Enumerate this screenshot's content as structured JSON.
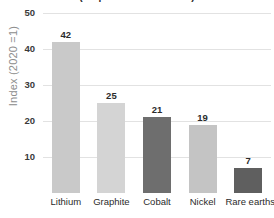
{
  "chart_data": {
    "type": "bar",
    "title": "(output relative to 2020)",
    "xlabel": "",
    "ylabel": "Index (2020 =1)",
    "categories": [
      "Lithium",
      "Graphite",
      "Cobalt",
      "Nickel",
      "Rare earths"
    ],
    "values": [
      42,
      25,
      21,
      19,
      7
    ],
    "value_labels": [
      "42",
      "25",
      "21",
      "19",
      "7"
    ],
    "ylim": [
      0,
      50
    ],
    "yticks": [
      10,
      20,
      30,
      40,
      50
    ],
    "ytick_labels": [
      "10",
      "20",
      "30",
      "40",
      "50"
    ],
    "grid": true,
    "legend": false,
    "bar_colors": [
      "#c9c9c9",
      "#d4d4d4",
      "#6e6e6e",
      "#c4c4c4",
      "#5f5f5f"
    ],
    "colors": {
      "grid": "#e2e2e2",
      "tick_text": "#3a3a3a",
      "axis_title": "#8d8d8d",
      "value_text": "#2b2b2b",
      "background": "#ffffff"
    }
  }
}
